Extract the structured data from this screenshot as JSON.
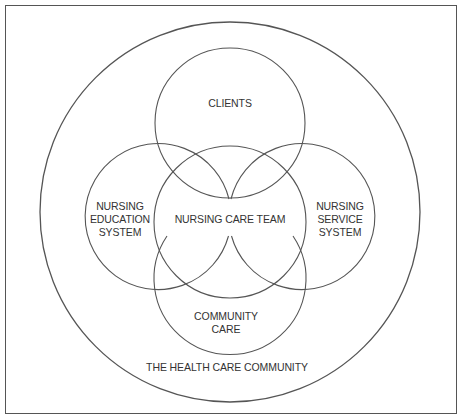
{
  "diagram": {
    "type": "venn-nested",
    "outer_label": "THE HEALTH CARE COMMUNITY",
    "circles": [
      {
        "id": "clients",
        "lines": [
          "CLIENTS"
        ]
      },
      {
        "id": "nursing-education-system",
        "lines": [
          "NURSING",
          "EDUCATION",
          "SYSTEM"
        ]
      },
      {
        "id": "nursing-care-team",
        "lines": [
          "NURSING CARE TEAM"
        ]
      },
      {
        "id": "nursing-service-system",
        "lines": [
          "NURSING",
          "SERVICE",
          "SYSTEM"
        ]
      },
      {
        "id": "community-care",
        "lines": [
          "COMMUNITY",
          "CARE"
        ]
      }
    ]
  },
  "colors": {
    "line": "#555555",
    "text": "#333333",
    "background": "#ffffff"
  }
}
